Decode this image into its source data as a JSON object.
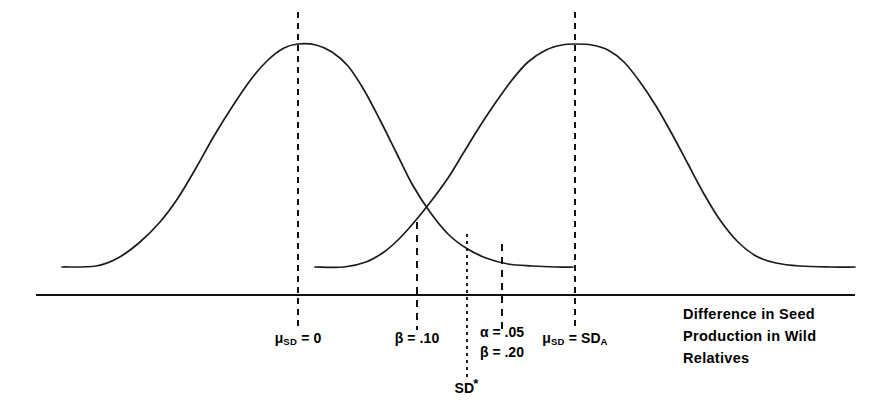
{
  "chart_data": {
    "type": "line",
    "title": "",
    "xlabel": "Difference in Seed Production in Wild Relatives",
    "ylabel": "",
    "grid": false,
    "legend": false,
    "axis": {
      "x_start_px": 36,
      "x_end_px": 855,
      "baseline_y_px": 295,
      "x_range_units": [
        -3.6,
        6.2
      ],
      "visible_ticks": false
    },
    "series": [
      {
        "name": "Null distribution (H0)",
        "center_label": "μ_SD = 0",
        "center_x_px": 298,
        "peak_y_px": 44,
        "tail_start_x_px": 62,
        "tail_end_x_px": 573,
        "tail_y_px": 267,
        "points": [
          [
            62,
            267
          ],
          [
            96,
            266
          ],
          [
            118,
            258
          ],
          [
            140,
            242
          ],
          [
            160,
            222
          ],
          [
            178,
            198
          ],
          [
            196,
            168
          ],
          [
            214,
            136
          ],
          [
            234,
            104
          ],
          [
            252,
            78
          ],
          [
            268,
            60
          ],
          [
            284,
            48
          ],
          [
            298,
            44
          ],
          [
            316,
            45
          ],
          [
            332,
            52
          ],
          [
            348,
            66
          ],
          [
            364,
            90
          ],
          [
            380,
            120
          ],
          [
            396,
            152
          ],
          [
            412,
            184
          ],
          [
            430,
            212
          ],
          [
            448,
            234
          ],
          [
            466,
            248
          ],
          [
            486,
            258
          ],
          [
            508,
            264
          ],
          [
            532,
            266
          ],
          [
            556,
            267
          ],
          [
            573,
            267
          ]
        ]
      },
      {
        "name": "Alternative distribution (HA)",
        "center_label": "μ_SD = SD_A",
        "center_x_px": 575,
        "peak_y_px": 44,
        "tail_start_x_px": 315,
        "tail_end_x_px": 855,
        "tail_y_px": 267,
        "points": [
          [
            315,
            267
          ],
          [
            344,
            267
          ],
          [
            366,
            262
          ],
          [
            384,
            252
          ],
          [
            400,
            238
          ],
          [
            416,
            220
          ],
          [
            432,
            200
          ],
          [
            448,
            178
          ],
          [
            464,
            152
          ],
          [
            480,
            126
          ],
          [
            496,
            102
          ],
          [
            512,
            80
          ],
          [
            528,
            62
          ],
          [
            546,
            50
          ],
          [
            562,
            45
          ],
          [
            575,
            44
          ],
          [
            592,
            45
          ],
          [
            608,
            50
          ],
          [
            624,
            62
          ],
          [
            640,
            82
          ],
          [
            656,
            106
          ],
          [
            672,
            134
          ],
          [
            688,
            164
          ],
          [
            704,
            194
          ],
          [
            720,
            220
          ],
          [
            738,
            242
          ],
          [
            756,
            256
          ],
          [
            776,
            263
          ],
          [
            800,
            266
          ],
          [
            830,
            267
          ],
          [
            855,
            267
          ]
        ]
      }
    ],
    "vertical_markers": [
      {
        "id": "mu-null",
        "label": "μ_SD = 0",
        "label_html": "μ<sub>SD</sub> = 0",
        "x_px": 298,
        "y_top_px": 12,
        "y_bottom_px": 330,
        "style": "long-dashed"
      },
      {
        "id": "beta-10",
        "label": "β = .10",
        "label_html": "β = .10",
        "x_px": 417,
        "y_top_px": 222,
        "y_bottom_px": 330,
        "style": "short-dashed"
      },
      {
        "id": "sd-critical",
        "label": "SD*",
        "label_html": "SD<span class=\"star\">*</span>",
        "x_px": 467,
        "y_top_px": 234,
        "y_bottom_px": 378,
        "style": "dotted"
      },
      {
        "id": "alpha-beta",
        "label": "α = .05 / β = .20",
        "x_px": 502,
        "y_top_px": 244,
        "y_bottom_px": 330,
        "style": "short-dashed"
      },
      {
        "id": "mu-alt",
        "label": "μ_SD = SD_A",
        "label_html": "μ<sub>SD</sub> = SD<sub>A</sub>",
        "x_px": 575,
        "y_top_px": 12,
        "y_bottom_px": 330,
        "style": "long-dashed"
      }
    ],
    "annotations": [
      {
        "id": "alpha-value",
        "text": "α = .05",
        "x_px": 502,
        "y_px": 329
      },
      {
        "id": "beta-value",
        "text": "β = .20",
        "x_px": 502,
        "y_px": 349
      }
    ]
  },
  "labels": {
    "mu_null": "μ",
    "mu_null_sub": "SD",
    "mu_null_eq": " = 0",
    "beta_10": "β = .10",
    "sd_star": "SD",
    "sd_star_mark": "*",
    "alpha_05": "α = .05",
    "beta_20": "β = .20",
    "mu_alt": "μ",
    "mu_alt_sub": "SD",
    "mu_alt_eq": " = SD",
    "mu_alt_sub2": "A"
  },
  "caption": {
    "line1": "Difference in Seed",
    "line2": "Production in Wild",
    "line3": "Relatives"
  },
  "colors": {
    "curve": "#1b1b1b",
    "axis": "#111111",
    "text": "#000000",
    "background": "#ffffff"
  }
}
